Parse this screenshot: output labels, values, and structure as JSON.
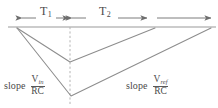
{
  "diagram": {
    "colors": {
      "line": "#8a8a8a",
      "baseline": "#9a9a9a",
      "dashed": "#b0b0b0",
      "text": "#4a4a4a",
      "background": "#ffffff"
    },
    "baseline": {
      "name": "zero-reference-line",
      "y": 27,
      "x_start": 8,
      "x_end": 216
    },
    "dashed_marker": {
      "name": "t1-end-marker",
      "x": 70,
      "y_top": 27,
      "y_bottom": 104
    },
    "intervals": [
      {
        "id": "T1",
        "label": "T",
        "subscript": "1",
        "x_start": 22,
        "x_end": 70,
        "arrow_y": 18,
        "label_x": 40,
        "label_y": 8
      },
      {
        "id": "T2",
        "label": "T",
        "subscript": "2",
        "x_start": 70,
        "x_end": 148,
        "arrow_y": 18,
        "label_x": 101,
        "label_y": 8
      },
      {
        "id": "T3",
        "label": "",
        "subscript": "",
        "x_start": 155,
        "x_end": 212,
        "arrow_y": 18,
        "label_x": 0,
        "label_y": 0
      }
    ],
    "waveforms": [
      {
        "name": "small-input-ramp",
        "points": "17,28 70,62 155,28"
      },
      {
        "name": "large-input-ramp",
        "points": "17,28 71,96 211,28"
      }
    ],
    "annotations": [
      {
        "name": "slope-vin-rc",
        "word": "slope",
        "numerator": "V",
        "numerator_sub": "in",
        "denominator": "RC",
        "x": 4,
        "y": 76
      },
      {
        "name": "slope-vref-rc",
        "word": "slope",
        "numerator": "V",
        "numerator_sub": "ref",
        "denominator": "RC",
        "x": 126,
        "y": 76
      }
    ]
  }
}
